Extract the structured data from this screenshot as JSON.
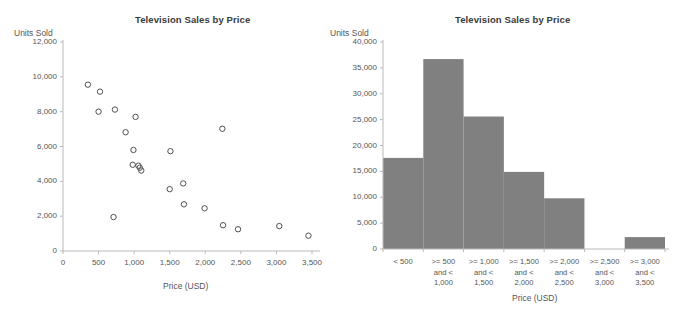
{
  "chart_data": [
    {
      "id": "scatter",
      "type": "scatter",
      "title": "Television Sales by Price",
      "xlabel": "Price (USD)",
      "ylabel": "Units Sold",
      "xlim": [
        0,
        3500
      ],
      "ylim": [
        0,
        12000
      ],
      "grid": false,
      "legend": "none",
      "xticks": [
        "0",
        "500",
        "1,000",
        "1,500",
        "2,000",
        "2,500",
        "3,000",
        "3,500"
      ],
      "xtick_values": [
        0,
        500,
        1000,
        1500,
        2000,
        2500,
        3000,
        3500
      ],
      "yticks": [
        "0",
        "2,000",
        "4,000",
        "6,000",
        "8,000",
        "10,000",
        "12,000"
      ],
      "ytick_values": [
        0,
        2000,
        4000,
        6000,
        8000,
        10000,
        12000
      ],
      "points": [
        {
          "x": 350,
          "y": 9550
        },
        {
          "x": 500,
          "y": 8000
        },
        {
          "x": 520,
          "y": 9150
        },
        {
          "x": 710,
          "y": 1950
        },
        {
          "x": 730,
          "y": 8120
        },
        {
          "x": 880,
          "y": 6820
        },
        {
          "x": 980,
          "y": 4950
        },
        {
          "x": 990,
          "y": 5800
        },
        {
          "x": 1020,
          "y": 7700
        },
        {
          "x": 1060,
          "y": 4900
        },
        {
          "x": 1080,
          "y": 4780
        },
        {
          "x": 1100,
          "y": 4620
        },
        {
          "x": 1500,
          "y": 3550
        },
        {
          "x": 1510,
          "y": 5730
        },
        {
          "x": 1690,
          "y": 3880
        },
        {
          "x": 1700,
          "y": 2680
        },
        {
          "x": 1990,
          "y": 2450
        },
        {
          "x": 2240,
          "y": 7020
        },
        {
          "x": 2250,
          "y": 1480
        },
        {
          "x": 2460,
          "y": 1250
        },
        {
          "x": 3040,
          "y": 1430
        },
        {
          "x": 3450,
          "y": 880
        }
      ]
    },
    {
      "id": "histogram",
      "type": "bar",
      "title": "Television Sales by Price",
      "xlabel": "Price (USD)",
      "ylabel": "Units Sold",
      "ylim": [
        0,
        40000
      ],
      "grid": false,
      "legend": "none",
      "bar_color": "#808080",
      "categories": [
        "<  500",
        ">= 500\nand <\n1,000",
        ">= 1,000\nand <\n1,500",
        ">= 1,500\nand <\n2,000",
        ">= 2,000\nand <\n2,500",
        ">= 2,500\nand <\n3,000",
        ">= 3,000\nand <\n3,500"
      ],
      "category_lines": [
        [
          "<  500"
        ],
        [
          ">= 500",
          "and <",
          "1,000"
        ],
        [
          ">= 1,000",
          "and <",
          "1,500"
        ],
        [
          ">= 1,500",
          "and <",
          "2,000"
        ],
        [
          ">= 2,000",
          "and <",
          "2,500"
        ],
        [
          ">= 2,500",
          "and <",
          "3,000"
        ],
        [
          ">= 3,000",
          "and <",
          "3,500"
        ]
      ],
      "values": [
        17600,
        36700,
        25600,
        14900,
        9800,
        0,
        2300
      ],
      "yticks": [
        "0",
        "5,000",
        "10,000",
        "15,000",
        "20,000",
        "25,000",
        "30,000",
        "35,000",
        "40,000"
      ],
      "ytick_values": [
        0,
        5000,
        10000,
        15000,
        20000,
        25000,
        30000,
        35000,
        40000
      ]
    }
  ]
}
